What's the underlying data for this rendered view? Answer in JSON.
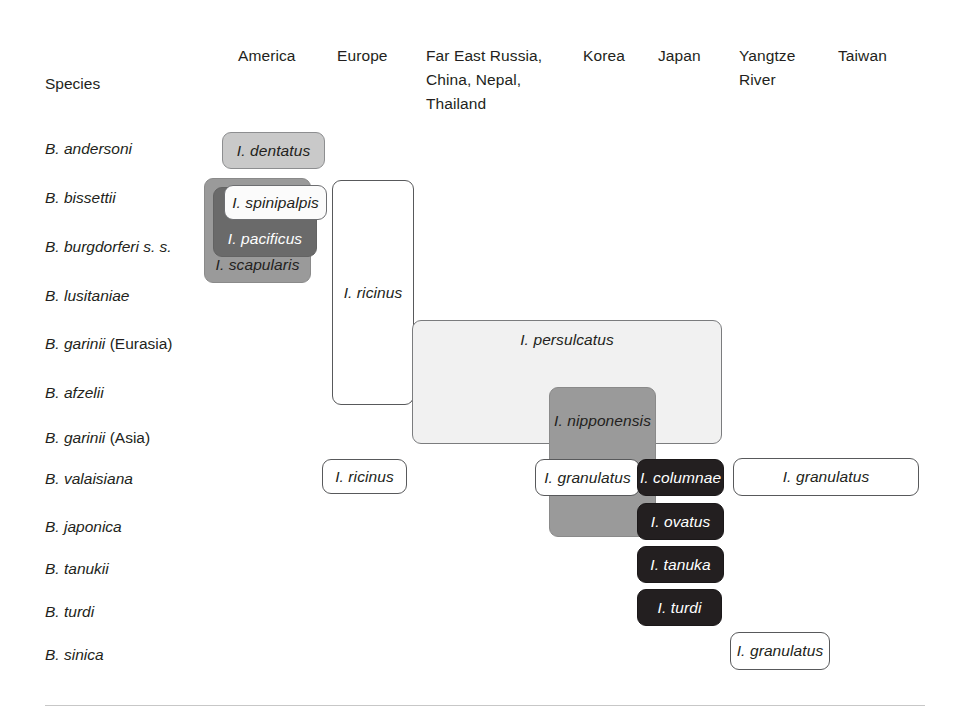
{
  "figure": {
    "axis_title": "Species",
    "columns": [
      {
        "label": "America",
        "x": 238,
        "y": 44
      },
      {
        "label": "Europe",
        "x": 337,
        "y": 44
      },
      {
        "label": "Far East Russia,\nChina, Nepal,\nThailand",
        "x": 426,
        "y": 44
      },
      {
        "label": "Korea",
        "x": 583,
        "y": 44
      },
      {
        "label": "Japan",
        "x": 658,
        "y": 44
      },
      {
        "label": "Yangtze\nRiver",
        "x": 739,
        "y": 44
      },
      {
        "label": "Taiwan",
        "x": 838,
        "y": 44
      }
    ],
    "species_rows": [
      {
        "name": "B. andersoni",
        "suffix": "",
        "y": 139
      },
      {
        "name": "B. bissettii",
        "suffix": "",
        "y": 188
      },
      {
        "name": "B. burgdorferi s. s.",
        "suffix": "",
        "y": 237
      },
      {
        "name": "B. lusitaniae",
        "suffix": "",
        "y": 286
      },
      {
        "name": "B. garinii ",
        "suffix": "(Eurasia)",
        "y": 334
      },
      {
        "name": "B. afzelii",
        "suffix": "",
        "y": 383
      },
      {
        "name": "B. garinii ",
        "suffix": "(Asia)",
        "y": 428
      },
      {
        "name": "B. valaisiana",
        "suffix": "",
        "y": 469
      },
      {
        "name": "B. japonica",
        "suffix": "",
        "y": 517
      },
      {
        "name": "B. tanukii",
        "suffix": "",
        "y": 559
      },
      {
        "name": "B. turdi",
        "suffix": "",
        "y": 602
      },
      {
        "name": "B. sinica",
        "suffix": "",
        "y": 645
      }
    ],
    "vectors": [
      {
        "label": "I. dentatus",
        "shade": "v-light",
        "x": 222,
        "y": 132,
        "w": 103,
        "h": 37,
        "align": "center",
        "valign": "center",
        "z": 5
      },
      {
        "label": "I. scapularis",
        "shade": "v-medium",
        "x": 204,
        "y": 178,
        "w": 107,
        "h": 105,
        "align": "center",
        "valign": "bottom",
        "z": 2
      },
      {
        "label": "I. pacificus",
        "shade": "v-dark",
        "x": 213,
        "y": 187,
        "w": 104,
        "h": 70,
        "align": "center",
        "valign": "bottom",
        "z": 3
      },
      {
        "label": "I. spinipalpis",
        "shade": "v-offwhite",
        "x": 224,
        "y": 185,
        "w": 103,
        "h": 35,
        "align": "center",
        "valign": "center",
        "z": 4
      },
      {
        "label": "I. ricinus",
        "shade": "v-white",
        "x": 332,
        "y": 180,
        "w": 82,
        "h": 225,
        "align": "center",
        "valign": "center",
        "z": 2
      },
      {
        "label": "I. persulcatus",
        "shade": "v-verylight",
        "x": 412,
        "y": 320,
        "w": 310,
        "h": 124,
        "align": "center",
        "valign": "top",
        "z": 2
      },
      {
        "label": "I. nipponensis",
        "shade": "v-medium",
        "x": 549,
        "y": 387,
        "w": 107,
        "h": 150,
        "align": "center",
        "valign": "upper",
        "z": 3
      },
      {
        "label": "I. ricinus",
        "shade": "v-white",
        "x": 322,
        "y": 459,
        "w": 85,
        "h": 35,
        "align": "center",
        "valign": "center",
        "z": 5
      },
      {
        "label": "I. granulatus",
        "shade": "v-white",
        "x": 535,
        "y": 459,
        "w": 105,
        "h": 37,
        "align": "center",
        "valign": "center",
        "z": 6
      },
      {
        "label": "I. columnae",
        "shade": "v-black",
        "x": 637,
        "y": 459,
        "w": 87,
        "h": 37,
        "align": "center",
        "valign": "center",
        "z": 7
      },
      {
        "label": "I. granulatus",
        "shade": "v-white",
        "x": 733,
        "y": 458,
        "w": 186,
        "h": 38,
        "align": "center",
        "valign": "center",
        "z": 5
      },
      {
        "label": "I. ovatus",
        "shade": "v-black",
        "x": 637,
        "y": 503,
        "w": 87,
        "h": 37,
        "align": "center",
        "valign": "center",
        "z": 7
      },
      {
        "label": "I. tanuka",
        "shade": "v-black",
        "x": 637,
        "y": 546,
        "w": 87,
        "h": 37,
        "align": "center",
        "valign": "center",
        "z": 7
      },
      {
        "label": "I. turdi",
        "shade": "v-black",
        "x": 637,
        "y": 589,
        "w": 85,
        "h": 37,
        "align": "center",
        "valign": "center",
        "z": 7
      },
      {
        "label": "I. granulatus",
        "shade": "v-white",
        "x": 730,
        "y": 632,
        "w": 100,
        "h": 38,
        "align": "center",
        "valign": "center",
        "z": 5
      }
    ],
    "footer_rule": {
      "x": 45,
      "y": 705,
      "w": 880
    }
  }
}
